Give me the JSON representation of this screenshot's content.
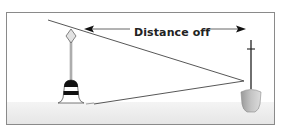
{
  "diagram": {
    "label": "Distance off",
    "elements": [
      {
        "name": "buoy",
        "type": "navigation-buoy",
        "position": "left"
      },
      {
        "name": "boat",
        "type": "vessel-mast",
        "position": "right"
      },
      {
        "name": "sight-line-top",
        "from": "buoy-top",
        "to": "boat-mast"
      },
      {
        "name": "sight-line-bottom",
        "from": "buoy-waterline",
        "to": "boat-mast"
      },
      {
        "name": "distance-arrow",
        "direction": "both",
        "spans": "buoy-to-boat"
      }
    ],
    "colors": {
      "frame": "#888888",
      "line": "#333333",
      "water": "#ececec",
      "buoy_band": "#111111",
      "hull": "#a8a8a8"
    }
  }
}
